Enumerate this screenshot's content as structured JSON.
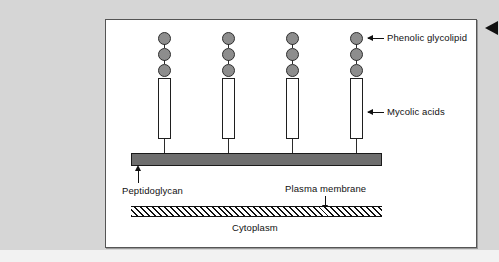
{
  "figure": {
    "background_color": "#d6d6d6",
    "panel_color": "#ffffff",
    "frame_color": "#555555",
    "structures": {
      "glycolipid_color": "#8d8d8d",
      "peptidoglycan_color": "#6e6e6e",
      "mycolic_acid_color": "#ffffff",
      "membrane_hatch_color": "#111111"
    },
    "labels": {
      "phenolic_glycolipid": "Phenolic glycolipid",
      "mycolic_acids": "Mycolic acids",
      "peptidoglycan": "Peptidoglycan",
      "plasma_membrane": "Plasma membrane",
      "cytoplasm": "Cytoplasm"
    },
    "columns": [
      {
        "id": "column-1",
        "left": 48,
        "dots": 3
      },
      {
        "id": "column-2",
        "left": 112,
        "dots": 3
      },
      {
        "id": "column-3",
        "left": 176,
        "dots": 3
      },
      {
        "id": "column-4",
        "left": 240,
        "dots": 3
      }
    ]
  }
}
